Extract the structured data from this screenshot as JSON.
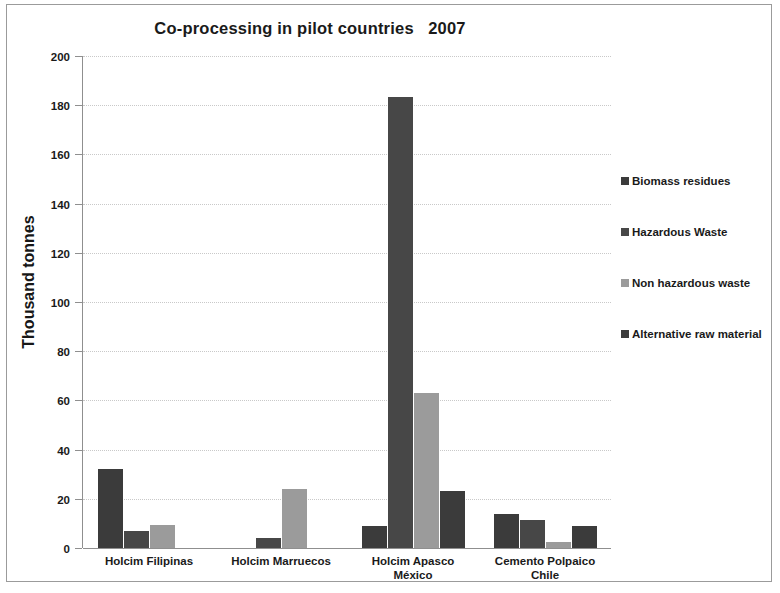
{
  "chart_data": {
    "type": "bar",
    "title": "Co-processing in pilot countries   2007",
    "xlabel": "",
    "ylabel": "Thousand tonnes",
    "ylim": [
      0,
      200
    ],
    "ytick_step": 20,
    "yticks": [
      "200",
      "180",
      "160",
      "140",
      "120",
      "100",
      "80",
      "60",
      "40",
      "20",
      "0"
    ],
    "grid": true,
    "legend_position": "right",
    "categories": [
      "Holcim Filipinas",
      "Holcim Marruecos",
      "Holcim Apasco México",
      "Cemento Polpaico Chile"
    ],
    "category_lines": [
      [
        "Holcim Filipinas"
      ],
      [
        "Holcim Marruecos"
      ],
      [
        "Holcim Apasco",
        "México"
      ],
      [
        "Cemento Polpaico",
        "Chile"
      ]
    ],
    "series": [
      {
        "name": "Biomass residues",
        "color": "#3b3b3b",
        "values": [
          32,
          0,
          9,
          14
        ]
      },
      {
        "name": "Hazardous Waste",
        "color": "#474747",
        "values": [
          7,
          4,
          183.5,
          11.5
        ]
      },
      {
        "name": "Non hazardous waste",
        "color": "#9b9b9b",
        "values": [
          9.5,
          24,
          63,
          2.5
        ]
      },
      {
        "name": "Alternative raw material",
        "color": "#3b3b3b",
        "values": [
          0,
          0,
          23,
          9
        ]
      }
    ]
  },
  "style": {
    "frame_border": "#9b9b9b",
    "axis_color": "#8f8f8f",
    "gridline_color": "#c9c9c9",
    "text_color": "#1a1a1a",
    "background": "#ffffff"
  }
}
